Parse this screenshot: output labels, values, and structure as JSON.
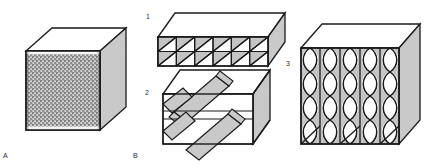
{
  "figure": {
    "background_color": "#ffffff",
    "width": 431,
    "height": 168
  },
  "palette": {
    "outline": "#1a1a1a",
    "top_face": "#ffffff",
    "side_face": "#c9c9c9",
    "cell_shade": "#c4c4c4",
    "bar_fill": "#c9c9c9",
    "mesh_light": "#d8d8d8",
    "mesh_dark": "#8a8a8a",
    "label_color": "#2b2b2b"
  },
  "labels": {
    "panel_a": "A",
    "panel_b": "B",
    "sub_one": "1",
    "sub_two": "2",
    "sub_three": "3"
  },
  "panels": [
    {
      "id": "a",
      "label": "A",
      "shape": "cube",
      "front_face": "fine-orthogonal-grid-mesh",
      "grid_columns": 26,
      "grid_rows": 26,
      "top_face_fill": "#ffffff",
      "right_face_fill": "#c9c9c9",
      "description": "Cube with finely woven orthogonal mesh on the front face"
    },
    {
      "id": "b1",
      "label": "1",
      "shape": "flat-box",
      "cell_columns": 6,
      "cell_rows": 2,
      "cell_diagonal": "bottom-left-to-top-right",
      "shaded_triangle": "upper-left",
      "top_face_fill": "#ffffff",
      "right_face_fill": "#c9c9c9",
      "description": "Flat box with 6 by 2 triangulated cells on the front face"
    },
    {
      "id": "b2",
      "label": "2",
      "shape": "flat-box",
      "bar_count": 4,
      "bar_orientation": "diagonal-interlaced",
      "bar_fill": "#c9c9c9",
      "layers": 2,
      "description": "Flat box with interwoven diagonal slab reinforcements passing through two layers"
    },
    {
      "id": "b3",
      "label": "3",
      "shape": "cube",
      "columns": 5,
      "wave_cycles": 4,
      "fiber_pattern": "sinusoidal-column-fibers",
      "top_face_fill": "#ffffff",
      "right_face_fill": "#c9c9c9",
      "description": "Cube with five vertical columns of paired sinusoidal fibers forming oval cells"
    }
  ]
}
